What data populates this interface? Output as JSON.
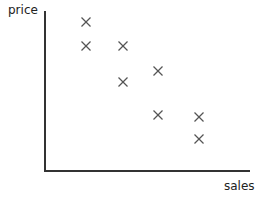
{
  "chart_data": {
    "type": "scatter",
    "title": "",
    "xlabel": "sales",
    "ylabel": "price",
    "grid": false,
    "legend": null,
    "marker": "x",
    "marker_color": "#555555",
    "axis_color": "#333333",
    "ticks": "none",
    "points_px": [
      {
        "x": 86,
        "y": 22
      },
      {
        "x": 86,
        "y": 46
      },
      {
        "x": 123,
        "y": 46
      },
      {
        "x": 123,
        "y": 82
      },
      {
        "x": 158,
        "y": 71
      },
      {
        "x": 158,
        "y": 115
      },
      {
        "x": 199,
        "y": 117
      },
      {
        "x": 199,
        "y": 139
      }
    ],
    "points_relative": [
      {
        "sales": 0.2,
        "price": 0.93
      },
      {
        "sales": 0.2,
        "price": 0.78
      },
      {
        "sales": 0.38,
        "price": 0.78
      },
      {
        "sales": 0.38,
        "price": 0.55
      },
      {
        "sales": 0.55,
        "price": 0.62
      },
      {
        "sales": 0.55,
        "price": 0.35
      },
      {
        "sales": 0.75,
        "price": 0.34
      },
      {
        "sales": 0.75,
        "price": 0.2
      }
    ]
  }
}
